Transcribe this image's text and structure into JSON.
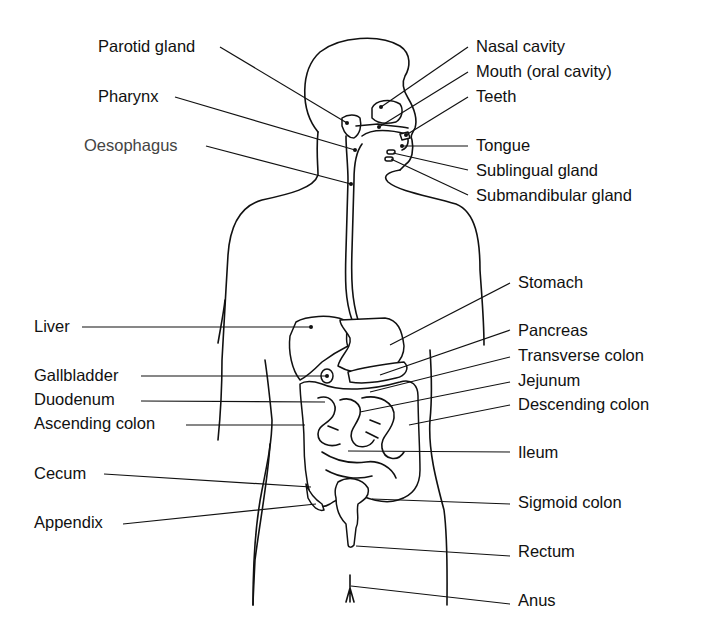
{
  "diagram": {
    "labels_left": [
      {
        "id": "parotid-gland",
        "text": "Parotid gland"
      },
      {
        "id": "pharynx",
        "text": "Pharynx"
      },
      {
        "id": "oesophagus",
        "text": "Oesophagus"
      },
      {
        "id": "liver",
        "text": "Liver"
      },
      {
        "id": "gallbladder",
        "text": "Gallbladder"
      },
      {
        "id": "duodenum",
        "text": "Duodenum"
      },
      {
        "id": "ascending-colon",
        "text": "Ascending colon"
      },
      {
        "id": "cecum",
        "text": "Cecum"
      },
      {
        "id": "appendix",
        "text": "Appendix"
      }
    ],
    "labels_right": [
      {
        "id": "nasal-cavity",
        "text": "Nasal cavity"
      },
      {
        "id": "mouth",
        "text": "Mouth (oral cavity)"
      },
      {
        "id": "teeth",
        "text": "Teeth"
      },
      {
        "id": "tongue",
        "text": "Tongue"
      },
      {
        "id": "sublingual-gland",
        "text": "Sublingual gland"
      },
      {
        "id": "submandibular-gland",
        "text": "Submandibular gland"
      },
      {
        "id": "stomach",
        "text": "Stomach"
      },
      {
        "id": "pancreas",
        "text": "Pancreas"
      },
      {
        "id": "transverse-colon",
        "text": "Transverse colon"
      },
      {
        "id": "jejunum",
        "text": "Jejunum"
      },
      {
        "id": "descending-colon",
        "text": "Descending colon"
      },
      {
        "id": "ileum",
        "text": "Ileum"
      },
      {
        "id": "sigmoid-colon",
        "text": "Sigmoid colon"
      },
      {
        "id": "rectum",
        "text": "Rectum"
      },
      {
        "id": "anus",
        "text": "Anus"
      }
    ],
    "colors": {
      "line": "#111111",
      "label": "#111111",
      "label_muted": "#444444",
      "background": "#ffffff"
    }
  }
}
